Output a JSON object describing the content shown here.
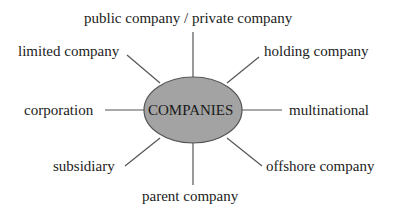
{
  "diagram": {
    "type": "spider-diagram",
    "center": {
      "label": "COMPANIES",
      "fill": "#a3a3a3",
      "stroke": "#555555"
    },
    "line_color": "#555555",
    "nodes": [
      {
        "id": "top",
        "label": "public company / private company"
      },
      {
        "id": "top-left",
        "label": "limited company"
      },
      {
        "id": "top-right",
        "label": "holding company"
      },
      {
        "id": "left",
        "label": "corporation"
      },
      {
        "id": "right",
        "label": "multinational"
      },
      {
        "id": "bottom-left",
        "label": "subsidiary"
      },
      {
        "id": "bottom-right",
        "label": "offshore company"
      },
      {
        "id": "bottom",
        "label": "parent company"
      }
    ]
  }
}
